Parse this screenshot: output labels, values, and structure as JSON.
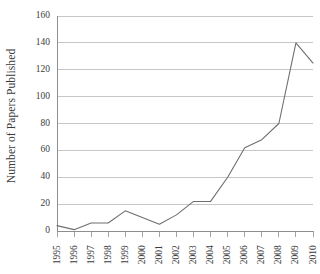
{
  "chart_data": {
    "type": "line",
    "title": "",
    "xlabel": "",
    "ylabel": "Number of Papers Published",
    "categories": [
      "1995",
      "1996",
      "1997",
      "1998",
      "1999",
      "2000",
      "2001",
      "2002",
      "2003",
      "2004",
      "2005",
      "2006",
      "2007",
      "2008",
      "2009",
      "2010"
    ],
    "values": [
      4,
      1,
      6,
      6,
      15,
      10,
      5,
      12,
      22,
      22,
      40,
      62,
      68,
      80,
      140,
      125
    ],
    "series": [
      {
        "name": "Papers Published",
        "values": [
          4,
          1,
          6,
          6,
          15,
          10,
          5,
          12,
          22,
          22,
          40,
          62,
          68,
          80,
          140,
          125
        ]
      }
    ],
    "ylim": [
      0,
      160
    ],
    "yticks": [
      0,
      20,
      40,
      60,
      80,
      100,
      120,
      140,
      160
    ],
    "ytick_labels": [
      "0",
      "20",
      "40",
      "60",
      "80",
      "100",
      "120",
      "140",
      "160"
    ],
    "grid": "horizontal",
    "legend": "none",
    "line_color": "#6f6f6f",
    "grid_color": "#b9b9b9",
    "axis_color": "#8d8d8d",
    "text_color": "#3b3b3b",
    "background": "#ffffff",
    "markers": false,
    "xtick_rotation": -90
  }
}
